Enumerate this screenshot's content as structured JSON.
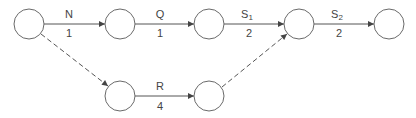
{
  "diagram": {
    "type": "activity-on-arrow network",
    "colors": {
      "stroke": "#6a6a6a",
      "text": "#444444",
      "background": "#ffffff"
    },
    "nodes": [
      {
        "id": "n1",
        "x": 29,
        "y": 24
      },
      {
        "id": "n2",
        "x": 120,
        "y": 24
      },
      {
        "id": "n3",
        "x": 209,
        "y": 24
      },
      {
        "id": "n4",
        "x": 299,
        "y": 24
      },
      {
        "id": "n5",
        "x": 389,
        "y": 24
      },
      {
        "id": "n6",
        "x": 120,
        "y": 96
      },
      {
        "id": "n7",
        "x": 209,
        "y": 96
      }
    ],
    "edges": [
      {
        "from": "n1",
        "to": "n2",
        "activity": "N",
        "duration": "1",
        "style": "solid"
      },
      {
        "from": "n2",
        "to": "n3",
        "activity": "Q",
        "duration": "1",
        "style": "solid"
      },
      {
        "from": "n3",
        "to": "n4",
        "activity": "S",
        "activity_sub": "1",
        "duration": "2",
        "style": "solid"
      },
      {
        "from": "n4",
        "to": "n5",
        "activity": "S",
        "activity_sub": "2",
        "duration": "2",
        "style": "solid"
      },
      {
        "from": "n6",
        "to": "n7",
        "activity": "R",
        "duration": "4",
        "style": "solid"
      },
      {
        "from": "n1",
        "to": "n6",
        "activity": "",
        "duration": "",
        "style": "dashed"
      },
      {
        "from": "n7",
        "to": "n4",
        "activity": "",
        "duration": "",
        "style": "dashed"
      }
    ]
  }
}
